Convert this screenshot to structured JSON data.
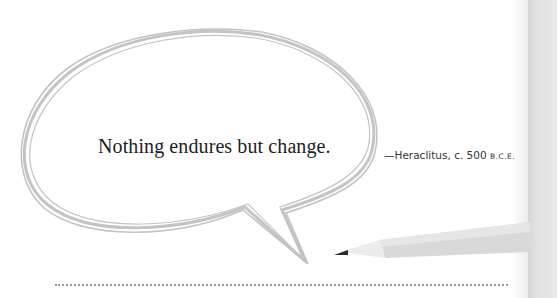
{
  "quote": {
    "text": "Nothing endures but change."
  },
  "attribution": {
    "prefix": "—Heraclitus, c. 500 ",
    "era": "B.C.E."
  },
  "illustration": {
    "speech_bubble_icon": "speech-bubble-icon",
    "pencil_icon": "pencil-icon",
    "outline_color": "#c4c4c4",
    "pencil_color": "#d9d9d9",
    "pencil_tip_color": "#2a2a2a"
  },
  "colors": {
    "background": "#ffffff",
    "side_panel": "#e2e2e2",
    "text": "#1e1e1e",
    "rule": "#9a9a9a"
  }
}
